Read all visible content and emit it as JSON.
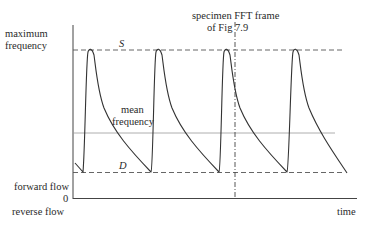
{
  "diagram": {
    "y_axis_labels": {
      "top_line1": "maximum",
      "top_line2": "frequency",
      "forward": "forward flow",
      "zero": "0",
      "reverse": "reverse flow"
    },
    "x_axis_label": "time",
    "systolic_label": "S",
    "diastolic_label": "D",
    "mean_label_line1": "mean",
    "mean_label_line2": "frequency",
    "annotation_line1": "specimen FFT  frame",
    "annotation_line2": "of Fig 7.9",
    "colors": {
      "stroke": "#333333",
      "mean_line": "#9a9a9a"
    },
    "cycles": 4
  }
}
